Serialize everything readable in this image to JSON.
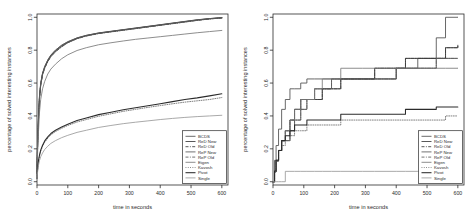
{
  "figure": {
    "title": "",
    "panels": [
      "left",
      "right"
    ]
  },
  "axes": {
    "xlabel": "time in seconds",
    "ylabel": "percentage of solved interesting instances",
    "xticks": [
      "0",
      "100",
      "200",
      "300",
      "400",
      "500",
      "600"
    ],
    "xtickvals": [
      0,
      100,
      200,
      300,
      400,
      500,
      600
    ],
    "yticks": [
      "0.0",
      "0.2",
      "0.4",
      "0.6",
      "0.8",
      "1.0"
    ],
    "ytickvals": [
      0.0,
      0.2,
      0.4,
      0.6,
      0.8,
      1.0
    ],
    "xlim": [
      0,
      620
    ],
    "ylim": [
      -0.02,
      1.02
    ]
  },
  "legend": {
    "position": "bottom-right",
    "entries": [
      {
        "label": "BCDS",
        "color": "#4d4d4d",
        "dash": "none",
        "width": "thin"
      },
      {
        "label": "ReD New",
        "color": "#3a3a3a",
        "dash": "none",
        "width": "thin"
      },
      {
        "label": "ReD Old",
        "color": "#3a3a3a",
        "dash": "dashdot",
        "width": "thin"
      },
      {
        "label": "ReP New",
        "color": "#5a5a5a",
        "dash": "none",
        "width": "thin"
      },
      {
        "label": "ReP Old",
        "color": "#5a5a5a",
        "dash": "dashdot",
        "width": "thin"
      },
      {
        "label": "Eigen",
        "color": "#787878",
        "dash": "none",
        "width": "thin"
      },
      {
        "label": "Kavosh",
        "color": "#6a6a6a",
        "dash": "dotted",
        "width": "thin"
      },
      {
        "label": "Pivot",
        "color": "#2b2b2b",
        "dash": "none",
        "width": "thick"
      },
      {
        "label": "Single",
        "color": "#9a9a9a",
        "dash": "none",
        "width": "thin"
      }
    ]
  },
  "chart_data": [
    {
      "type": "line",
      "panel": "left",
      "title": "",
      "xlabel": "time in seconds",
      "ylabel": "percentage of solved interesting instances",
      "xlim": [
        0,
        620
      ],
      "ylim": [
        -0.02,
        1.02
      ],
      "grid": false,
      "legend_position": "bottom-right",
      "x": [
        0,
        2,
        5,
        8,
        12,
        18,
        25,
        35,
        45,
        60,
        80,
        100,
        130,
        160,
        200,
        240,
        280,
        320,
        360,
        400,
        440,
        480,
        520,
        560,
        600
      ],
      "series": [
        {
          "name": "BCDS",
          "values": [
            0.06,
            0.24,
            0.4,
            0.52,
            0.6,
            0.66,
            0.7,
            0.74,
            0.77,
            0.8,
            0.83,
            0.85,
            0.875,
            0.89,
            0.905,
            0.915,
            0.925,
            0.935,
            0.945,
            0.955,
            0.965,
            0.975,
            0.985,
            0.992,
            0.998
          ]
        },
        {
          "name": "ReD New",
          "values": [
            0.06,
            0.23,
            0.39,
            0.51,
            0.59,
            0.655,
            0.695,
            0.735,
            0.765,
            0.795,
            0.825,
            0.848,
            0.872,
            0.888,
            0.903,
            0.913,
            0.923,
            0.933,
            0.943,
            0.953,
            0.963,
            0.973,
            0.983,
            0.991,
            0.997
          ]
        },
        {
          "name": "ReD Old",
          "values": [
            0.05,
            0.22,
            0.38,
            0.5,
            0.585,
            0.65,
            0.69,
            0.73,
            0.76,
            0.79,
            0.82,
            0.845,
            0.87,
            0.886,
            0.901,
            0.911,
            0.921,
            0.931,
            0.941,
            0.951,
            0.961,
            0.971,
            0.981,
            0.99,
            0.996
          ]
        },
        {
          "name": "ReP New",
          "values": [
            0.06,
            0.235,
            0.395,
            0.515,
            0.595,
            0.66,
            0.7,
            0.74,
            0.77,
            0.8,
            0.83,
            0.852,
            0.874,
            0.89,
            0.904,
            0.914,
            0.924,
            0.934,
            0.944,
            0.954,
            0.964,
            0.974,
            0.984,
            0.992,
            0.998
          ]
        },
        {
          "name": "ReP Old",
          "values": [
            0.05,
            0.225,
            0.385,
            0.505,
            0.59,
            0.652,
            0.692,
            0.732,
            0.762,
            0.792,
            0.822,
            0.846,
            0.87,
            0.887,
            0.902,
            0.912,
            0.922,
            0.932,
            0.942,
            0.952,
            0.962,
            0.972,
            0.982,
            0.99,
            0.996
          ]
        },
        {
          "name": "Eigen",
          "values": [
            0.04,
            0.18,
            0.31,
            0.42,
            0.5,
            0.565,
            0.61,
            0.655,
            0.685,
            0.715,
            0.748,
            0.772,
            0.798,
            0.815,
            0.833,
            0.845,
            0.856,
            0.866,
            0.874,
            0.882,
            0.89,
            0.898,
            0.906,
            0.913,
            0.92
          ]
        },
        {
          "name": "Kavosh",
          "values": [
            0.02,
            0.075,
            0.125,
            0.155,
            0.185,
            0.215,
            0.24,
            0.265,
            0.285,
            0.305,
            0.325,
            0.342,
            0.363,
            0.378,
            0.398,
            0.413,
            0.428,
            0.44,
            0.452,
            0.463,
            0.474,
            0.484,
            0.492,
            0.5,
            0.512
          ]
        },
        {
          "name": "Pivot",
          "values": [
            0.02,
            0.08,
            0.13,
            0.162,
            0.192,
            0.222,
            0.248,
            0.273,
            0.293,
            0.313,
            0.333,
            0.35,
            0.372,
            0.388,
            0.408,
            0.423,
            0.438,
            0.45,
            0.462,
            0.474,
            0.487,
            0.5,
            0.51,
            0.522,
            0.535
          ]
        },
        {
          "name": "Single",
          "values": [
            0.02,
            0.06,
            0.102,
            0.128,
            0.152,
            0.175,
            0.196,
            0.216,
            0.233,
            0.25,
            0.268,
            0.282,
            0.3,
            0.313,
            0.33,
            0.342,
            0.353,
            0.362,
            0.37,
            0.378,
            0.385,
            0.391,
            0.396,
            0.4,
            0.404
          ]
        }
      ]
    },
    {
      "type": "line",
      "panel": "right",
      "title": "",
      "xlabel": "time in seconds",
      "ylabel": "percentage of solved interesting instances",
      "xlim": [
        0,
        620
      ],
      "ylim": [
        -0.02,
        1.02
      ],
      "grid": false,
      "legend_position": "bottom-right",
      "step": true,
      "x": [
        0,
        5,
        10,
        18,
        28,
        40,
        55,
        70,
        90,
        110,
        135,
        160,
        190,
        220,
        250,
        290,
        330,
        370,
        400,
        430,
        470,
        500,
        530,
        560,
        600
      ],
      "series": [
        {
          "name": "BCDS",
          "values": [
            0.0,
            0.13,
            0.22,
            0.32,
            0.44,
            0.5,
            0.565,
            0.565,
            0.6,
            0.625,
            0.625,
            0.625,
            0.625,
            0.625,
            0.625,
            0.625,
            0.625,
            0.625,
            0.69,
            0.69,
            0.75,
            0.75,
            0.875,
            1.0,
            1.0
          ]
        },
        {
          "name": "ReD New",
          "values": [
            0.0,
            0.06,
            0.13,
            0.19,
            0.25,
            0.31,
            0.375,
            0.44,
            0.5,
            0.5,
            0.5,
            0.565,
            0.565,
            0.625,
            0.625,
            0.625,
            0.69,
            0.69,
            0.69,
            0.75,
            0.75,
            0.75,
            0.75,
            0.815,
            0.83
          ]
        },
        {
          "name": "ReD Old",
          "values": [
            0.0,
            0.06,
            0.13,
            0.19,
            0.25,
            0.31,
            0.375,
            0.44,
            0.5,
            0.5,
            0.5,
            0.565,
            0.565,
            0.625,
            0.625,
            0.625,
            0.69,
            0.69,
            0.69,
            0.75,
            0.75,
            0.75,
            0.75,
            0.815,
            0.83
          ]
        },
        {
          "name": "ReP New",
          "values": [
            0.0,
            0.06,
            0.125,
            0.19,
            0.25,
            0.25,
            0.31,
            0.375,
            0.44,
            0.5,
            0.565,
            0.565,
            0.625,
            0.625,
            0.625,
            0.625,
            0.625,
            0.625,
            0.69,
            0.69,
            0.69,
            0.69,
            0.75,
            0.75,
            0.75
          ]
        },
        {
          "name": "ReP Old",
          "values": [
            0.0,
            0.06,
            0.125,
            0.19,
            0.25,
            0.25,
            0.31,
            0.375,
            0.44,
            0.5,
            0.565,
            0.565,
            0.625,
            0.625,
            0.625,
            0.625,
            0.625,
            0.625,
            0.69,
            0.69,
            0.69,
            0.69,
            0.75,
            0.75,
            0.75
          ]
        },
        {
          "name": "Eigen",
          "values": [
            0.0,
            0.06,
            0.125,
            0.19,
            0.25,
            0.31,
            0.375,
            0.44,
            0.5,
            0.5,
            0.565,
            0.625,
            0.625,
            0.69,
            0.69,
            0.69,
            0.69,
            0.69,
            0.69,
            0.69,
            0.69,
            0.69,
            0.69,
            0.69,
            0.69
          ]
        },
        {
          "name": "Kavosh",
          "values": [
            0.0,
            0.065,
            0.13,
            0.19,
            0.22,
            0.25,
            0.28,
            0.31,
            0.31,
            0.345,
            0.345,
            0.345,
            0.345,
            0.375,
            0.375,
            0.375,
            0.375,
            0.375,
            0.375,
            0.375,
            0.375,
            0.375,
            0.375,
            0.4,
            0.4
          ]
        },
        {
          "name": "Pivot",
          "values": [
            0.0,
            0.065,
            0.13,
            0.19,
            0.25,
            0.28,
            0.31,
            0.345,
            0.345,
            0.375,
            0.375,
            0.375,
            0.375,
            0.41,
            0.41,
            0.41,
            0.41,
            0.41,
            0.41,
            0.44,
            0.44,
            0.44,
            0.455,
            0.455,
            0.455
          ]
        },
        {
          "name": "Single",
          "values": [
            0.0,
            0.0,
            0.0,
            0.0,
            0.0,
            0.063,
            0.063,
            0.063,
            0.063,
            0.063,
            0.063,
            0.063,
            0.063,
            0.063,
            0.063,
            0.063,
            0.063,
            0.063,
            0.063,
            0.063,
            0.063,
            0.063,
            0.063,
            0.063,
            0.063
          ]
        }
      ]
    }
  ]
}
